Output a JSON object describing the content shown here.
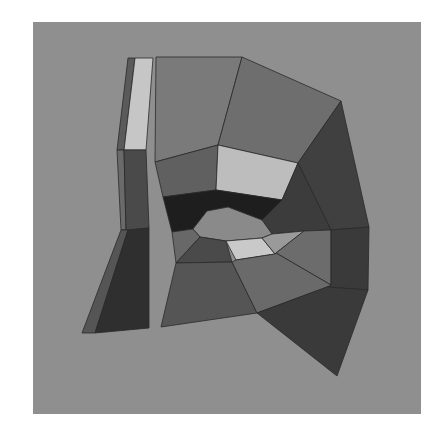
{
  "render": {
    "description": "Flat-shaded low-poly 3D mesh of mouth and lip region",
    "background_color": "#8f8f8f",
    "viewport": {
      "x": 33,
      "y": 22,
      "width": 388,
      "height": 392
    }
  },
  "mesh": {
    "faces": [
      {
        "name": "left-strip-outer-edge",
        "color": "#5a5a5a",
        "points": "128,58 135,58 124,150 117,150"
      },
      {
        "name": "left-strip-top-light",
        "color": "#c6c6c6",
        "points": "135,58 153,58 146,150 124,150"
      },
      {
        "name": "left-strip-side-sliver",
        "color": "#6a6a6a",
        "points": "117,150 124,150 126,230 121,230"
      },
      {
        "name": "left-strip-mid",
        "color": "#4a4a4a",
        "points": "124,150 146,150 149,228 126,230"
      },
      {
        "name": "left-strip-bottom-outer",
        "color": "#555555",
        "points": "121,230 128,230 95,333 82,333"
      },
      {
        "name": "left-strip-bottom",
        "color": "#2f2f2f",
        "points": "128,230 149,228 149,328 95,333"
      },
      {
        "name": "upper-face-left",
        "color": "#7a7a7a",
        "points": "156,57 242,57 218,145 155,162"
      },
      {
        "name": "upper-face-right",
        "color": "#6e6e6e",
        "points": "242,57 341,101 298,163 218,145"
      },
      {
        "name": "right-cheek-dark",
        "color": "#404040",
        "points": "341,101 369,227 331,230 298,163"
      },
      {
        "name": "upper-lip-left",
        "color": "#606060",
        "points": "155,162 218,145 216,190 163,197"
      },
      {
        "name": "upper-lip-light",
        "color": "#bdbdbd",
        "points": "218,145 298,163 282,200 216,190"
      },
      {
        "name": "upper-lip-right-dark",
        "color": "#3c3c3c",
        "points": "298,163 331,230 304,231 272,234 262,220 282,200"
      },
      {
        "name": "inner-lip-dark-band",
        "color": "#1e1e1e",
        "points": "163,197 216,190 282,200 262,220 228,207 207,211 193,229 172,232"
      },
      {
        "name": "mouth-opening",
        "color": "#8a8a8a",
        "points": "193,229 207,211 228,207 262,220 272,234 262,238 226,241 200,237"
      },
      {
        "name": "lower-lip-left-small",
        "color": "#686868",
        "points": "172,232 193,229 200,237 176,263"
      },
      {
        "name": "lower-lip-left-dark",
        "color": "#4a4a4a",
        "points": "200,237 226,241 232,262 176,263"
      },
      {
        "name": "lower-lip-light",
        "color": "#c9c9c9",
        "points": "226,241 262,238 275,254 236,260"
      },
      {
        "name": "lower-lip-right-light",
        "color": "#9a9a9a",
        "points": "262,238 272,234 304,231 276,253 275,254"
      },
      {
        "name": "lower-lip-right-mid",
        "color": "#6c6c6c",
        "points": "304,231 331,230 331,285 276,253"
      },
      {
        "name": "right-column-dark",
        "color": "#3a3a3a",
        "points": "331,230 369,227 368,290 327,287 331,285"
      },
      {
        "name": "chin-left",
        "color": "#555555",
        "points": "176,263 232,262 257,313 161,327"
      },
      {
        "name": "chin-center",
        "color": "#6a6a6a",
        "points": "232,262 236,260 275,254 276,253 331,285 327,287 257,313"
      },
      {
        "name": "chin-right-dark",
        "color": "#3a3a3a",
        "points": "257,313 327,287 368,290 337,376"
      }
    ]
  }
}
